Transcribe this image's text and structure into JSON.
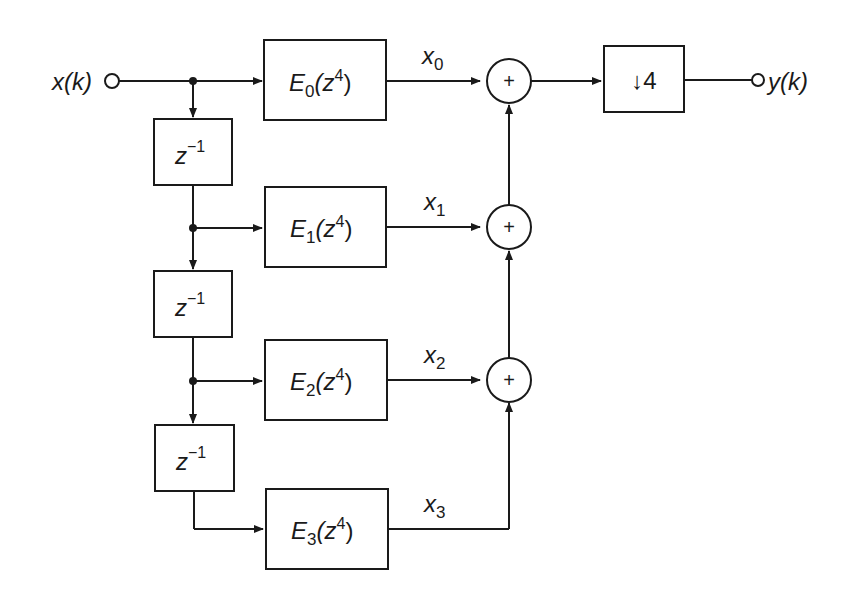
{
  "diagram": {
    "type": "block-diagram",
    "input": {
      "label": "x(k)"
    },
    "output": {
      "label": "y(k)"
    },
    "delays": [
      {
        "label": "z",
        "sup": "−1"
      },
      {
        "label": "z",
        "sup": "−1"
      },
      {
        "label": "z",
        "sup": "−1"
      }
    ],
    "filters": [
      {
        "name": "E",
        "sub": "0",
        "arg_open": "(z",
        "arg_sup": "4",
        "arg_close": ")"
      },
      {
        "name": "E",
        "sub": "1",
        "arg_open": "(z",
        "arg_sup": "4",
        "arg_close": ")"
      },
      {
        "name": "E",
        "sub": "2",
        "arg_open": "(z",
        "arg_sup": "4",
        "arg_close": ")"
      },
      {
        "name": "E",
        "sub": "3",
        "arg_open": "(z",
        "arg_sup": "4",
        "arg_close": ")"
      }
    ],
    "signals": [
      {
        "name": "x",
        "sub": "0"
      },
      {
        "name": "x",
        "sub": "1"
      },
      {
        "name": "x",
        "sub": "2"
      },
      {
        "name": "x",
        "sub": "3"
      }
    ],
    "adders": [
      {
        "symbol": "+"
      },
      {
        "symbol": "+"
      },
      {
        "symbol": "+"
      }
    ],
    "downsampler": {
      "label": "↓4"
    },
    "colors": {
      "stroke": "#1a1a1a",
      "background": "#ffffff"
    }
  }
}
